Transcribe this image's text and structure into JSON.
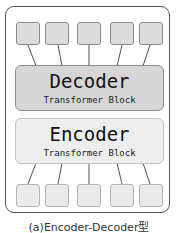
{
  "diagram": {
    "decoder": {
      "title": "Decoder",
      "subtitle": "Transformer Block"
    },
    "encoder": {
      "title": "Encoder",
      "subtitle": "Transformer Block"
    },
    "output_tokens": 5,
    "input_tokens": 5,
    "caption": "(a)Encoder-Decoder型",
    "colors": {
      "decoder_fill": "#d6d6d6",
      "encoder_fill": "#eeeeee",
      "frame": "#555555"
    }
  }
}
